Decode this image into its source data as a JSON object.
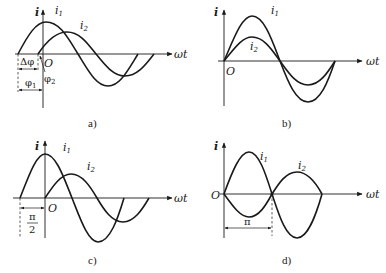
{
  "figure": {
    "axis_labels": {
      "y": "i",
      "x": "ωt",
      "origin": "O"
    },
    "panels": [
      {
        "id": "a",
        "caption": "a)",
        "curves": [
          {
            "label": "i",
            "subscript": "1",
            "description": "leads i2 by Δφ"
          },
          {
            "label": "i",
            "subscript": "2",
            "description": "smaller amplitude, lags"
          }
        ],
        "annotations": {
          "phase_difference": "Δφ",
          "phi1": "φ",
          "phi1_sub": "1",
          "phi2": "φ",
          "phi2_sub": "2"
        }
      },
      {
        "id": "b",
        "caption": "b)",
        "curves": [
          {
            "label": "i",
            "subscript": "1",
            "description": "in phase, larger amplitude"
          },
          {
            "label": "i",
            "subscript": "2",
            "description": "in phase, smaller amplitude"
          }
        ]
      },
      {
        "id": "c",
        "caption": "c)",
        "curves": [
          {
            "label": "i",
            "subscript": "1",
            "description": "leads i2 by π/2"
          },
          {
            "label": "i",
            "subscript": "2",
            "description": "starts at origin"
          }
        ],
        "annotations": {
          "shift_numerator": "π",
          "shift_denominator": "2"
        }
      },
      {
        "id": "d",
        "caption": "d)",
        "curves": [
          {
            "label": "i",
            "subscript": "1",
            "description": "anti-phase to i2"
          },
          {
            "label": "i",
            "subscript": "2",
            "description": "anti-phase to i1"
          }
        ],
        "annotations": {
          "shift": "π"
        }
      }
    ]
  }
}
